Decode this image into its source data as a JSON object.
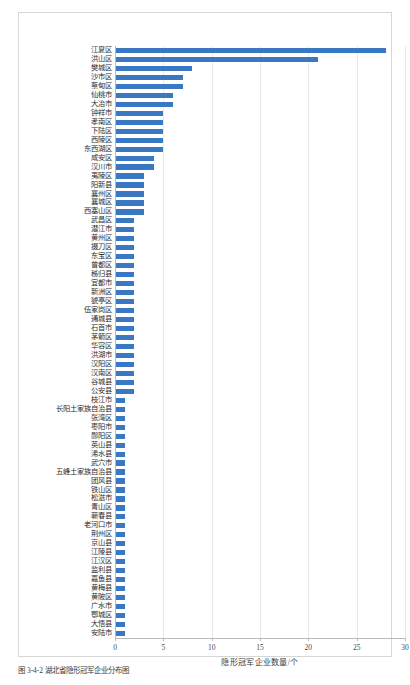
{
  "figure": {
    "caption": "图 3-4-2  湖北省隐形冠军企业分布图"
  },
  "chart_data": {
    "type": "bar",
    "orientation": "horizontal",
    "title": "",
    "xlabel": "隐形冠军企业数量/个",
    "ylabel": "",
    "xlim": [
      0,
      30
    ],
    "xticks": [
      0,
      5,
      10,
      15,
      20,
      25,
      30
    ],
    "xticklabels": [
      "0",
      "5",
      "10",
      "15",
      "20",
      "25",
      "30"
    ],
    "grid": true,
    "grid_axis": "x",
    "legend": "none",
    "bar_color": "#3b78c3",
    "categories": [
      "江夏区",
      "洪山区",
      "樊城区",
      "沙市区",
      "蔡甸区",
      "仙桃市",
      "大冶市",
      "钟祥市",
      "孝南区",
      "下陆区",
      "西陵区",
      "东西湖区",
      "咸安区",
      "汉川市",
      "夷陵区",
      "阳新县",
      "襄州区",
      "襄城区",
      "西塞山区",
      "武昌区",
      "潜江市",
      "黄州区",
      "掇刀区",
      "东宝区",
      "曾都区",
      "秭归县",
      "宜都市",
      "新洲区",
      "猇亭区",
      "伍家岗区",
      "通城县",
      "石首市",
      "茅箭区",
      "华容区",
      "洪湖市",
      "汉阳区",
      "汉南区",
      "谷城县",
      "公安县",
      "枝江市",
      "长阳土家族自治县",
      "张湾区",
      "枣阳市",
      "郧阳区",
      "英山县",
      "浠水县",
      "武穴市",
      "五峰土家族自治县",
      "团风县",
      "铁山区",
      "松滋市",
      "青山区",
      "蕲春县",
      "老河口市",
      "荆州区",
      "京山县",
      "江陵县",
      "江汉区",
      "监利县",
      "嘉鱼县",
      "黄梅县",
      "黄陂区",
      "广水市",
      "鄂城区",
      "大悟县",
      "安陆市"
    ],
    "values": [
      28,
      21,
      8,
      7,
      7,
      6,
      6,
      5,
      5,
      5,
      5,
      5,
      4,
      4,
      3,
      3,
      3,
      3,
      3,
      2,
      2,
      2,
      2,
      2,
      2,
      2,
      2,
      2,
      2,
      2,
      2,
      2,
      2,
      2,
      2,
      2,
      2,
      2,
      2,
      1,
      1,
      1,
      1,
      1,
      1,
      1,
      1,
      1,
      1,
      1,
      1,
      1,
      1,
      1,
      1,
      1,
      1,
      1,
      1,
      1,
      1,
      1,
      1,
      1,
      1,
      1
    ]
  }
}
